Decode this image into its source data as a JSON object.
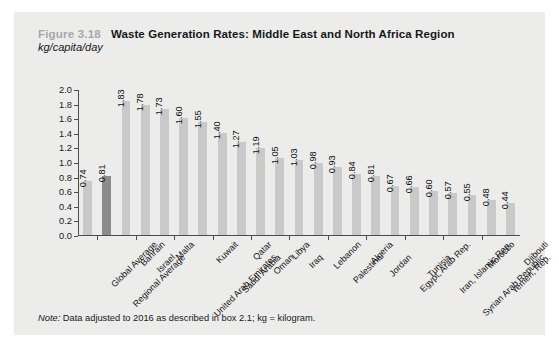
{
  "figure": {
    "number": "Figure 3.18",
    "title": "Waste Generation Rates: Middle East and North Africa Region",
    "subtitle": "kg/capita/day",
    "note_prefix": "Note:",
    "note_text": " Data adjusted to 2016 as described in box 2.1; kg = kilogram."
  },
  "colors": {
    "panel_background": "#ececeb",
    "bar": "#c9c9c9",
    "bar_highlight": "#8b8b8b",
    "axis": "#4c4c4c",
    "figure_number": "#a8a8a8",
    "text": "#16181a"
  },
  "chart_data": {
    "type": "bar",
    "title": "Waste Generation Rates: Middle East and North Africa Region",
    "xlabel": "",
    "ylabel": "kg/capita/day",
    "ylim": [
      0,
      2.0
    ],
    "ytick_step": 0.2,
    "yticks": [
      "0.0",
      "0.2",
      "0.4",
      "0.6",
      "0.8",
      "1.0",
      "1.2",
      "1.4",
      "1.6",
      "1.8",
      "2.0"
    ],
    "grid": false,
    "legend": "none",
    "highlight_category": "Regional Average",
    "categories": [
      "Global Average",
      "Regional Average",
      "Bahrain",
      "Israel",
      "Malta",
      "United Arab Emirates",
      "Kuwait",
      "Saudi Arabia",
      "Qatar",
      "Oman",
      "Libya",
      "Iraq",
      "Lebanon",
      "Palestine",
      "Algeria",
      "Jordan",
      "Egypt, Arab Rep.",
      "Tunisia",
      "Iran, Islamic Rep.",
      "Syrian Arab Republic",
      "Morocco",
      "Yemen, Rep.",
      "Djibouti"
    ],
    "values": [
      0.74,
      0.81,
      1.83,
      1.78,
      1.73,
      1.6,
      1.55,
      1.4,
      1.27,
      1.19,
      1.05,
      1.03,
      0.98,
      0.93,
      0.84,
      0.81,
      0.67,
      0.66,
      0.6,
      0.57,
      0.55,
      0.48,
      0.44
    ],
    "value_labels": [
      "0.74",
      "0.81",
      "1.83",
      "1.78",
      "1.73",
      "1.60",
      "1.55",
      "1.40",
      "1.27",
      "1.19",
      "1.05",
      "1.03",
      "0.98",
      "0.93",
      "0.84",
      "0.81",
      "0.67",
      "0.66",
      "0.60",
      "0.57",
      "0.55",
      "0.48",
      "0.44"
    ]
  }
}
